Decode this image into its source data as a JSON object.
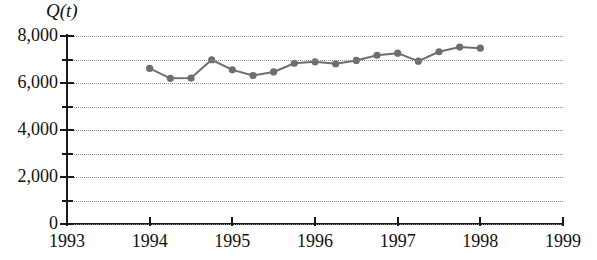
{
  "chart_data": {
    "type": "line",
    "title": "",
    "subtitle": "",
    "ylabel": "Q(t)",
    "xlabel": "",
    "grid": true,
    "legend": false,
    "marker": "circle",
    "series_color": "#6e6e6e",
    "axis_color": "#1a1a1a",
    "grid_color": "#8e8e8e",
    "xlim": [
      1993,
      1999
    ],
    "ylim": [
      0,
      8000
    ],
    "ytick_labels": [
      "0",
      "2,000",
      "4,000",
      "6,000",
      "8,000"
    ],
    "ytick_values": [
      0,
      2000,
      4000,
      6000,
      8000
    ],
    "yminor_values": [
      1000,
      3000,
      5000,
      7000
    ],
    "xtick_labels": [
      "1993",
      "1994",
      "1995",
      "1996",
      "1997",
      "1998",
      "1999"
    ],
    "xtick_values": [
      1993,
      1994,
      1995,
      1996,
      1997,
      1998,
      1999
    ],
    "x": [
      1994.0,
      1994.25,
      1994.5,
      1994.75,
      1995.0,
      1995.25,
      1995.5,
      1995.75,
      1996.0,
      1996.25,
      1996.5,
      1996.75,
      1997.0,
      1997.25,
      1997.5,
      1997.75,
      1998.0
    ],
    "values": [
      6620,
      6200,
      6210,
      6990,
      6560,
      6320,
      6470,
      6840,
      6900,
      6820,
      6960,
      7180,
      7270,
      6930,
      7330,
      7530,
      7480
    ],
    "series": [
      {
        "name": "Q(t)",
        "values": [
          6620,
          6200,
          6210,
          6990,
          6560,
          6320,
          6470,
          6840,
          6900,
          6820,
          6960,
          7180,
          7270,
          6930,
          7330,
          7530,
          7480
        ]
      }
    ]
  },
  "axis": {
    "ylabel": "Q(t)",
    "ytick_0": "0",
    "ytick_2000": "2,000",
    "ytick_4000": "4,000",
    "ytick_6000": "6,000",
    "ytick_8000": "8,000",
    "xtick_1993": "1993",
    "xtick_1994": "1994",
    "xtick_1995": "1995",
    "xtick_1996": "1996",
    "xtick_1997": "1997",
    "xtick_1998": "1998",
    "xtick_1999": "1999"
  }
}
